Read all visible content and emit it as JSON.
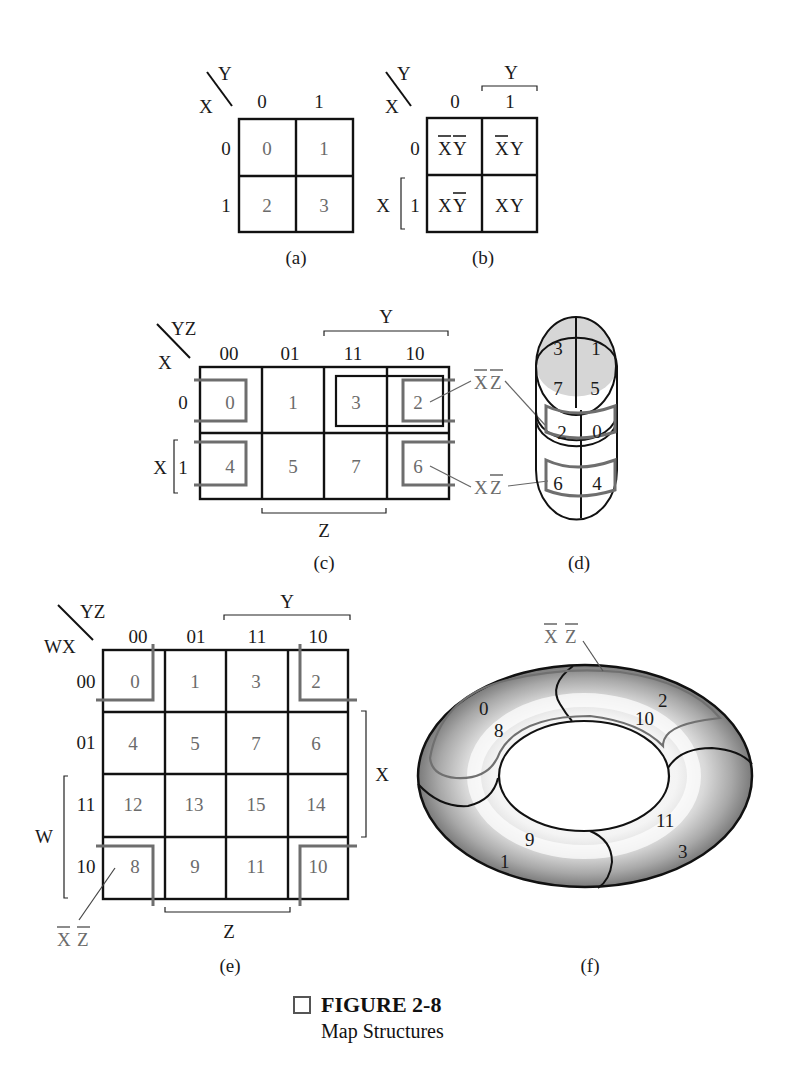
{
  "figure": {
    "number_label": "FIGURE 2-8",
    "caption": "Map Structures"
  },
  "panel_a": {
    "label": "(a)",
    "row_var": "X",
    "col_var": "Y",
    "col_headers": [
      "0",
      "1"
    ],
    "row_headers": [
      "0",
      "1"
    ],
    "cells": [
      [
        "0",
        "1"
      ],
      [
        "2",
        "3"
      ]
    ]
  },
  "panel_b": {
    "label": "(b)",
    "row_var": "X",
    "col_var": "Y",
    "col_headers": [
      "0",
      "1"
    ],
    "row_headers": [
      "0",
      "1"
    ],
    "col_bracket_label": "Y",
    "row_bracket_label": "X",
    "cells": [
      [
        {
          "a": "X",
          "a_bar": true,
          "b": "Y",
          "b_bar": true
        },
        {
          "a": "X",
          "a_bar": true,
          "b": "Y",
          "b_bar": false
        }
      ],
      [
        {
          "a": "X",
          "a_bar": false,
          "b": "Y",
          "b_bar": true
        },
        {
          "a": "X",
          "a_bar": false,
          "b": "Y",
          "b_bar": false
        }
      ]
    ]
  },
  "panel_c": {
    "label": "(c)",
    "row_var": "X",
    "col_var": "YZ",
    "col_headers": [
      "00",
      "01",
      "11",
      "10"
    ],
    "row_headers": [
      "0",
      "1"
    ],
    "col_bracket_top": "Y",
    "col_bracket_bottom": "Z",
    "row_bracket_label": "X",
    "cells": [
      [
        "0",
        "1",
        "3",
        "2"
      ],
      [
        "4",
        "5",
        "7",
        "6"
      ]
    ],
    "annotations": [
      {
        "text_a": "X",
        "a_bar": true,
        "text_b": "Z",
        "b_bar": true,
        "points_to": "cell 2"
      },
      {
        "text_a": "X",
        "a_bar": false,
        "text_b": "Z",
        "b_bar": true,
        "points_to": "cell 6"
      }
    ]
  },
  "panel_d": {
    "label": "(d)",
    "top_cells": [
      "3",
      "1",
      "7",
      "5"
    ],
    "side_cells": [
      "2",
      "0",
      "6",
      "4"
    ]
  },
  "panel_e": {
    "label": "(e)",
    "row_var": "WX",
    "col_var": "YZ",
    "col_headers": [
      "00",
      "01",
      "11",
      "10"
    ],
    "row_headers": [
      "00",
      "01",
      "11",
      "10"
    ],
    "col_bracket_top": "Y",
    "col_bracket_bottom": "Z",
    "row_bracket_right": "X",
    "row_bracket_left": "W",
    "cells": [
      [
        "0",
        "1",
        "3",
        "2"
      ],
      [
        "4",
        "5",
        "7",
        "6"
      ],
      [
        "12",
        "13",
        "15",
        "14"
      ],
      [
        "8",
        "9",
        "11",
        "10"
      ]
    ],
    "annotation": {
      "text_a": "X",
      "a_bar": true,
      "text_b": "Z",
      "b_bar": true
    }
  },
  "panel_f": {
    "label": "(f)",
    "annotation": {
      "text_a": "X",
      "a_bar": true,
      "text_b": "Z",
      "b_bar": true
    },
    "cells": [
      "0",
      "8",
      "2",
      "10",
      "9",
      "1",
      "11",
      "3"
    ]
  }
}
